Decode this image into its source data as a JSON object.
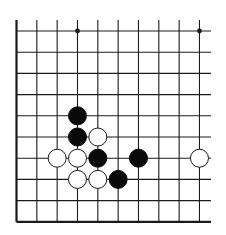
{
  "diagram": {
    "type": "go-board-fragment",
    "colors": {
      "background": "#ffffff",
      "line": "#1a1a1a",
      "black_stone": "#0a0a0a",
      "white_stone_fill": "#ffffff",
      "white_stone_stroke": "#1a1a1a"
    },
    "grid": {
      "columns": 10,
      "rows": 10,
      "x0": 16.5,
      "dx": 20.33,
      "y0": 31,
      "dy": 21.2,
      "line_top": 20,
      "line_right": 211,
      "left_edge_is_border": true,
      "bottom_edge_is_border": true
    },
    "star_points": [
      {
        "col": 3,
        "row": 0
      },
      {
        "col": 9,
        "row": 0
      }
    ],
    "stones": [
      {
        "color": "black",
        "col": 3,
        "row": 4
      },
      {
        "color": "black",
        "col": 3,
        "row": 5
      },
      {
        "color": "white",
        "col": 4,
        "row": 5
      },
      {
        "color": "white",
        "col": 2,
        "row": 6
      },
      {
        "color": "white",
        "col": 3,
        "row": 6
      },
      {
        "color": "black",
        "col": 4,
        "row": 6
      },
      {
        "color": "black",
        "col": 6,
        "row": 6
      },
      {
        "color": "white",
        "col": 9,
        "row": 6
      },
      {
        "color": "white",
        "col": 3,
        "row": 7
      },
      {
        "color": "white",
        "col": 4,
        "row": 7
      },
      {
        "color": "black",
        "col": 5,
        "row": 7
      }
    ],
    "stone_radius": 9
  }
}
